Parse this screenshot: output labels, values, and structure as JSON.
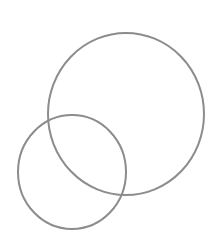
{
  "diagram": {
    "type": "overlapping-circles",
    "background": "#ffffff",
    "stroke_color": "#8c8c8c",
    "stroke_width": 2,
    "shapes": [
      {
        "id": "large-circle",
        "cx": 126,
        "cy": 114,
        "rx": 78,
        "ry": 81
      },
      {
        "id": "small-circle",
        "cx": 72,
        "cy": 172,
        "rx": 54,
        "ry": 57
      }
    ]
  }
}
